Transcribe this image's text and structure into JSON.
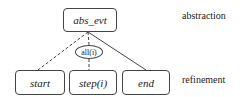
{
  "diagram": {
    "root": {
      "label": "abs_evt"
    },
    "combinator": {
      "label": "all(i)"
    },
    "children": [
      {
        "label": "start",
        "edge": "dashed"
      },
      {
        "label": "step(i)",
        "edge": "dashed-via-combinator"
      },
      {
        "label": "end",
        "edge": "solid"
      }
    ],
    "levels": {
      "top": "abstraction",
      "bottom": "refinement"
    },
    "colors": {
      "stroke": "#444444",
      "text": "#222222",
      "background": "#ffffff"
    }
  }
}
